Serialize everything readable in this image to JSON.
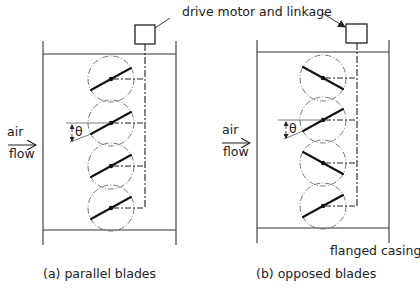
{
  "figure": {
    "callouts": {
      "drive": "drive motor and linkage",
      "casing": "flanged casing"
    },
    "panels": [
      {
        "id": "a",
        "caption": "(a) parallel blades",
        "air_label": "air",
        "flow_label": "flow",
        "angle_symbol": "θ",
        "blade_arrangement": [
          "rising",
          "rising",
          "rising",
          "rising"
        ]
      },
      {
        "id": "b",
        "caption": "(b) opposed blades",
        "air_label": "air",
        "flow_label": "flow",
        "angle_symbol": "θ",
        "blade_arrangement": [
          "falling",
          "rising",
          "falling",
          "rising"
        ]
      }
    ]
  }
}
